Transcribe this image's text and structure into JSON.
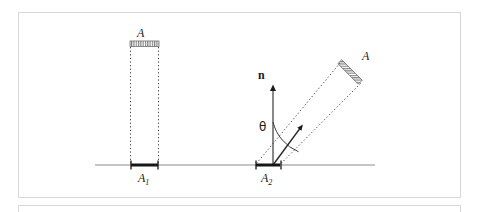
{
  "figure": {
    "title_labels": {
      "area_top": "A",
      "area_tilted": "A",
      "normal_vector": "n",
      "angle": "θ",
      "projected_area_1": "A",
      "projected_area_1_sub": "1",
      "projected_area_2": "A",
      "projected_area_2_sub": "2"
    },
    "colors": {
      "line": "#2b2b2b",
      "baseline": "#8c8c8c",
      "dotted": "#4a4a4a",
      "hatch": "#6e6e6e",
      "frame": "#d8d8d8",
      "background": "#ffffff"
    },
    "geometry": {
      "baseline_y": 165,
      "baseline_x_start": 95,
      "baseline_x_end": 375,
      "segment_A1": {
        "x1": 131,
        "x2": 158
      },
      "segment_A2": {
        "x1": 256,
        "x2": 280
      },
      "bar_top": {
        "x1": 130,
        "x2": 158,
        "y": 44
      },
      "bar_tilted": {
        "x1": 340,
        "y1": 62,
        "x2": 360,
        "y2": 82
      },
      "normal_arrow": {
        "x": 273,
        "y_top": 84,
        "y_bottom": 165
      },
      "direction_arrow": {
        "x1": 273,
        "y1": 165,
        "x2": 303,
        "y2": 124
      },
      "angle_deg_from_vertical": 36
    }
  }
}
